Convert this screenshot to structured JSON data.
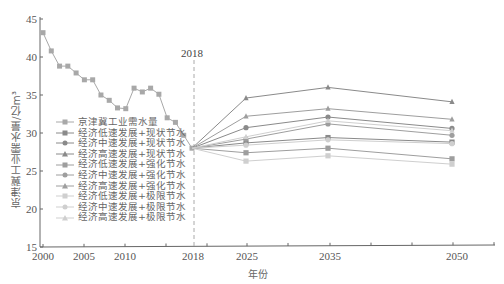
{
  "chart_data": {
    "type": "line",
    "title": "",
    "xlabel": "年份",
    "ylabel": "京津冀工业需水量/亿m³",
    "ylim": [
      15,
      45
    ],
    "yticks": [
      15,
      20,
      25,
      30,
      35,
      40,
      45
    ],
    "xtick_labels": [
      "2000",
      "2005",
      "2010",
      "",
      "2018",
      "2025",
      "",
      "2035",
      "",
      "",
      "2050"
    ],
    "annotation": {
      "label": "2018",
      "style": "dashed vertical line at 2018"
    },
    "grid": false,
    "legend_position": "inside lower-left",
    "historical": {
      "name": "京津冀工业需水量",
      "x": [
        2000,
        2001,
        2002,
        2003,
        2004,
        2005,
        2006,
        2007,
        2008,
        2009,
        2010,
        2011,
        2012,
        2013,
        2014,
        2015,
        2016,
        2017,
        2018
      ],
      "values": [
        43.2,
        40.8,
        38.8,
        38.8,
        37.9,
        37.0,
        37.0,
        35.0,
        34.3,
        33.3,
        33.2,
        35.9,
        35.4,
        35.9,
        35.1,
        32.0,
        31.4,
        29.7,
        28.0
      ]
    },
    "x": [
      2018,
      2025,
      2035,
      2050
    ],
    "series": [
      {
        "name": "经济低速发展+现状节水",
        "values": [
          28.0,
          28.7,
          29.4,
          28.8
        ],
        "marker": "square",
        "shade": "dark"
      },
      {
        "name": "经济中速发展+现状节水",
        "values": [
          28.0,
          30.7,
          32.1,
          30.6
        ],
        "marker": "circle",
        "shade": "dark"
      },
      {
        "name": "经济高速发展+现状节水",
        "values": [
          28.0,
          34.6,
          36.0,
          34.1
        ],
        "marker": "triangle",
        "shade": "dark"
      },
      {
        "name": "经济低速发展+强化节水",
        "values": [
          28.0,
          27.4,
          28.0,
          26.6
        ],
        "marker": "square",
        "shade": "medium"
      },
      {
        "name": "经济中速发展+强化节水",
        "values": [
          28.0,
          29.2,
          31.2,
          29.7
        ],
        "marker": "circle",
        "shade": "medium"
      },
      {
        "name": "经济高速发展+强化节水",
        "values": [
          28.0,
          32.2,
          33.2,
          31.8
        ],
        "marker": "triangle",
        "shade": "medium"
      },
      {
        "name": "经济低速发展+极限节水",
        "values": [
          28.0,
          26.3,
          27.0,
          25.9
        ],
        "marker": "square",
        "shade": "light"
      },
      {
        "name": "经济中速发展+极限节水",
        "values": [
          28.0,
          28.4,
          29.1,
          28.6
        ],
        "marker": "circle",
        "shade": "light"
      },
      {
        "name": "经济高速发展+极限节水",
        "values": [
          28.0,
          29.5,
          31.6,
          30.3
        ],
        "marker": "triangle",
        "shade": "light"
      }
    ],
    "colors": {
      "dark": "#8a8a8a",
      "medium": "#9e9e9e",
      "light": "#cfcfcf",
      "axis": "#666666",
      "historical": "#a8a8a8"
    }
  },
  "legend": [
    "京津冀工业需水量",
    "经济低速发展+现状节水",
    "经济中速发展+现状节水",
    "经济高速发展+现状节水",
    "经济低速发展+强化节水",
    "经济中速发展+强化节水",
    "经济高速发展+强化节水",
    "经济低速发展+极限节水",
    "经济中速发展+极限节水",
    "经济高速发展+极限节水"
  ],
  "labels": {
    "ylabel": "京津冀工业需水量/亿m³",
    "xlabel": "年份",
    "marker_2018": "2018"
  }
}
